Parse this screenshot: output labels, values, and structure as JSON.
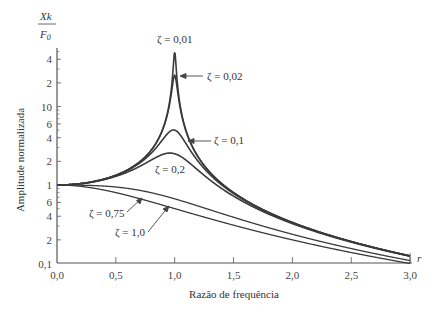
{
  "chart_data": {
    "type": "line",
    "title": "",
    "xlabel": "Razão de frequência",
    "ylabel": "Amplitude normalizada",
    "ylabel_top": {
      "numerator": "Xk",
      "denominator": "F",
      "denominator_sub": "0"
    },
    "x_axis_symbol": "r",
    "xlim": [
      0,
      3
    ],
    "ylim": [
      0.1,
      50
    ],
    "yscale": "log",
    "grid": false,
    "x_ticks": [
      0.0,
      0.5,
      1.0,
      1.5,
      2.0,
      2.5,
      3.0
    ],
    "x_tick_labels": [
      "0,0",
      "0,5",
      "1,0",
      "1,5",
      "2,0",
      "2,5",
      "3,0"
    ],
    "y_ticks": [
      0.1,
      0.2,
      0.4,
      0.6,
      1,
      2,
      4,
      6,
      10,
      20,
      40
    ],
    "y_tick_labels": [
      "0,1",
      "2",
      "4",
      "6",
      "1",
      "2",
      "4",
      "6",
      "10",
      "2",
      "4"
    ],
    "formula": "X/δst = 1/sqrt((1-r^2)^2 + (2ζr)^2)",
    "series": [
      {
        "name": "ζ = 0,01",
        "zeta": 0.01,
        "peak_value": 50
      },
      {
        "name": "ζ = 0,02",
        "zeta": 0.02,
        "peak_value": 25
      },
      {
        "name": "ζ = 0,1",
        "zeta": 0.1,
        "peak_value": 5
      },
      {
        "name": "ζ = 0,2",
        "zeta": 0.2,
        "peak_value": 2.5
      },
      {
        "name": "ζ = 0,75",
        "zeta": 0.75,
        "value_at_r1": 0.67
      },
      {
        "name": "ζ = 1,0",
        "zeta": 1.0,
        "value_at_r1": 0.5
      }
    ],
    "annotations": [
      {
        "text": "ζ = 0,01",
        "position": "above peak"
      },
      {
        "text": "ζ = 0,02",
        "arrow": true
      },
      {
        "text": "ζ = 0,1",
        "arrow": true
      },
      {
        "text": "ζ = 0,2"
      },
      {
        "text": "ζ = 0,75",
        "arrow": true
      },
      {
        "text": "ζ = 1,0",
        "arrow": true
      }
    ]
  }
}
